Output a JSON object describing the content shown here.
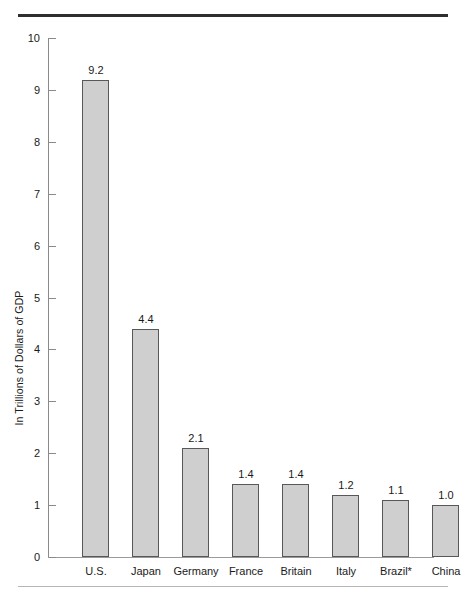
{
  "chart_data": {
    "type": "bar",
    "title": "",
    "subtitle": "",
    "xlabel": "",
    "ylabel": "In Trillions of Dollars of GDP",
    "categories": [
      "U.S.",
      "Japan",
      "Germany",
      "France",
      "Britain",
      "Italy",
      "Brazil*",
      "China"
    ],
    "values": [
      9.2,
      4.4,
      2.1,
      1.4,
      1.4,
      1.2,
      1.1,
      1.0
    ],
    "value_labels": [
      "9.2",
      "4.4",
      "2.1",
      "1.4",
      "1.4",
      "1.2",
      "1.1",
      "1.0"
    ],
    "ylim": [
      0,
      10
    ],
    "ytick_values": [
      0,
      1,
      2,
      3,
      4,
      5,
      6,
      7,
      8,
      9,
      10
    ],
    "ytick_labels": [
      "0",
      "1",
      "2",
      "3",
      "4",
      "5",
      "6",
      "7",
      "8",
      "9",
      "10"
    ],
    "grid": false,
    "legend": false,
    "legend_position": "none",
    "bar_fill_color": "#cfcfcf",
    "bar_border_color": "#585858",
    "axis_color": "#8a8a8a",
    "text_color": "#1a1a1a",
    "rule_top_color": "#2f2f2f",
    "rule_bottom_color": "#b6b6b6"
  }
}
